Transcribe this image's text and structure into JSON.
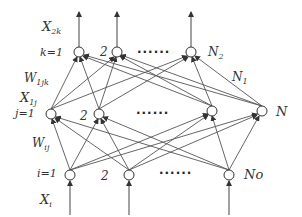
{
  "diagram": {
    "type": "three-layer feedforward neural network",
    "layers": {
      "output": {
        "label_var": "X",
        "label_sub": "2k",
        "index_label": "k=1",
        "nodes": [
          "k=1",
          "2",
          "N2"
        ],
        "node_labels": [
          "",
          "2",
          "N"
        ],
        "last_sub": "2",
        "ellipsis": "......"
      },
      "hidden": {
        "label_var": "X",
        "label_sub": "1j",
        "index_label": "j=1",
        "nodes": [
          "j=1",
          "2",
          "",
          "N"
        ],
        "node_labels": [
          "",
          "2",
          "",
          "N"
        ],
        "ellipsis": "......",
        "size_label_var": "N",
        "size_label_sub": "1"
      },
      "input": {
        "label_var": "X",
        "label_sub": "i",
        "index_label": "i=1",
        "nodes": [
          "i=1",
          "2",
          "No"
        ],
        "node_labels": [
          "",
          "2",
          "No"
        ],
        "ellipsis": "......"
      }
    },
    "weights": {
      "hidden_to_output": {
        "var": "W",
        "sub": "1jk"
      },
      "input_to_hidden": {
        "var": "W",
        "sub": "ij"
      }
    },
    "colors": {
      "line": "#444444",
      "text": "#333333",
      "background": "#ffffff"
    }
  }
}
